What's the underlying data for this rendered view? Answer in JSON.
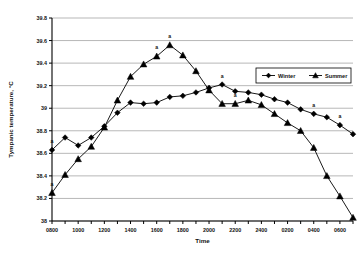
{
  "chart_data": {
    "type": "line",
    "title": "",
    "xlabel": "Time",
    "ylabel": "Tympanic temperature, °C",
    "ylim": [
      38.0,
      39.8
    ],
    "ytick_labels": [
      "38",
      "38.2",
      "38.4",
      "38.6",
      "38.8",
      "39",
      "39.2",
      "39.4",
      "39.6",
      "39.8"
    ],
    "ytick_values": [
      38.0,
      38.2,
      38.4,
      38.6,
      38.8,
      39.0,
      39.2,
      39.4,
      39.6,
      39.8
    ],
    "grid": true,
    "legend_position": "upper-right",
    "x": [
      "0800",
      "0900",
      "1000",
      "1100",
      "1200",
      "1300",
      "1400",
      "1500",
      "1600",
      "1700",
      "1800",
      "1900",
      "2000",
      "2100",
      "2200",
      "2300",
      "2400",
      "0100",
      "0200",
      "0300",
      "0400",
      "0500",
      "0600",
      "0700"
    ],
    "xtick_labels": [
      "0800",
      "1000",
      "1200",
      "1400",
      "1600",
      "1800",
      "2000",
      "2200",
      "2400",
      "0200",
      "0400",
      "0600"
    ],
    "xtick_label_step": 2,
    "series": [
      {
        "name": "Winter",
        "marker": "diamond",
        "values": [
          38.63,
          38.74,
          38.67,
          38.74,
          38.84,
          38.96,
          39.05,
          39.04,
          39.05,
          39.1,
          39.11,
          39.14,
          39.18,
          39.21,
          39.15,
          39.14,
          39.12,
          39.08,
          39.05,
          38.99,
          38.95,
          38.92,
          38.85,
          38.77
        ],
        "annotations": [
          {
            "x": "0800",
            "label": "a"
          },
          {
            "x": "2100",
            "label": "a"
          },
          {
            "x": "0400",
            "label": "a"
          },
          {
            "x": "0600",
            "label": "a"
          }
        ]
      },
      {
        "name": "Summer",
        "marker": "triangle",
        "values": [
          38.25,
          38.41,
          38.55,
          38.66,
          38.83,
          39.07,
          39.28,
          39.39,
          39.46,
          39.56,
          39.47,
          39.33,
          39.16,
          39.04,
          39.04,
          39.07,
          39.03,
          38.95,
          38.87,
          38.8,
          38.65,
          38.4,
          38.22,
          38.03
        ],
        "annotations": [
          {
            "x": "0800",
            "label": "a"
          },
          {
            "x": "1600",
            "label": "a"
          },
          {
            "x": "1700",
            "label": "a"
          },
          {
            "x": "2200",
            "label": "a"
          }
        ]
      }
    ]
  }
}
